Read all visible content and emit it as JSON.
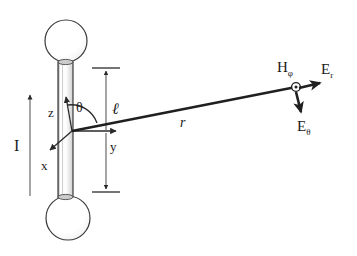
{
  "figure": {
    "background_color": "#ffffff",
    "line_color": "#2a2a2a",
    "sphere_outline_color": "#3a3a3a",
    "label_color": "#1a1a1a"
  },
  "labels": {
    "current": "I",
    "z_axis": "z",
    "x_axis": "x",
    "y_axis": "y",
    "theta": "θ",
    "length": "ℓ",
    "radius": "r",
    "h_phi_base": "H",
    "h_phi_sub": "φ",
    "e_r_base": "E",
    "e_r_sub": "r",
    "e_theta_base": "E",
    "e_theta_sub": "θ"
  },
  "geometry": {
    "origin": {
      "x": 72,
      "y": 131
    },
    "field_point": {
      "x": 296,
      "y": 87
    },
    "top_sphere": {
      "cx": 66,
      "cy": 41,
      "r": 21
    },
    "bottom_sphere": {
      "cx": 68,
      "cy": 218,
      "r": 22
    },
    "rod": {
      "left": 58,
      "right": 73,
      "top": 62,
      "bottom": 198
    },
    "current_arrow": {
      "x": 30,
      "y_tail": 196,
      "y_head": 95
    },
    "length_dim": {
      "x": 106,
      "y_top": 68,
      "y_bottom": 192
    },
    "z_axis_tip": {
      "x": 66,
      "y": 96
    },
    "y_axis_tip": {
      "x": 118,
      "y": 131
    },
    "x_axis_tip": {
      "x": 48,
      "y": 152
    },
    "theta_arc_radius": 26
  },
  "icons": {
    "field_point_marker": "circle-dot-out-of-page",
    "current_arrow": "up-arrow",
    "length_dimension": "double-ended-dimension-arrow"
  }
}
